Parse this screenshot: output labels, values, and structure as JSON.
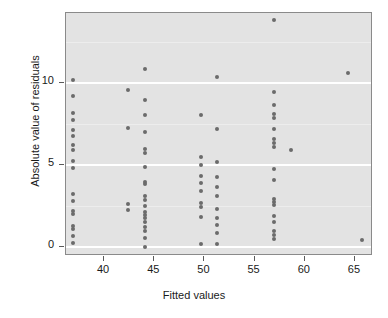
{
  "chart_data": {
    "type": "scatter",
    "title": "",
    "xlabel": "Fitted values",
    "ylabel": "Absolute value of residuals",
    "xlim": [
      36.2,
      66.8
    ],
    "ylim": [
      -0.55,
      14.3
    ],
    "xticks": [
      40,
      45,
      50,
      55,
      60,
      65
    ],
    "xticklabels": [
      "40",
      "45",
      "50",
      "55",
      "60",
      "65"
    ],
    "yticks": [
      0,
      5,
      10
    ],
    "yticklabels": [
      "0",
      "5",
      "10"
    ],
    "grid": true,
    "grid_major_color": "#ffffff",
    "grid_minor_color": "#ededed",
    "panel_background": "#e3e3e3",
    "point_color": "#6b6b6b",
    "point_size_px": 4,
    "series": [
      {
        "name": "residuals",
        "points": [
          [
            36.9,
            10.2
          ],
          [
            36.9,
            9.25
          ],
          [
            36.9,
            8.2
          ],
          [
            36.9,
            7.75
          ],
          [
            36.9,
            7.15
          ],
          [
            36.9,
            6.8
          ],
          [
            36.9,
            6.25
          ],
          [
            36.9,
            5.9
          ],
          [
            36.9,
            5.25
          ],
          [
            36.9,
            4.8
          ],
          [
            36.9,
            3.25
          ],
          [
            36.9,
            2.8
          ],
          [
            36.9,
            2.2
          ],
          [
            36.9,
            2.0
          ],
          [
            36.9,
            1.3
          ],
          [
            36.9,
            1.1
          ],
          [
            36.9,
            0.65
          ],
          [
            36.9,
            0.25
          ],
          [
            42.4,
            9.6
          ],
          [
            42.4,
            7.3
          ],
          [
            42.4,
            2.6
          ],
          [
            42.4,
            2.25
          ],
          [
            44.1,
            10.85
          ],
          [
            44.1,
            9.0
          ],
          [
            44.1,
            8.05
          ],
          [
            44.1,
            7.0
          ],
          [
            44.1,
            6.0
          ],
          [
            44.1,
            5.75
          ],
          [
            44.1,
            4.9
          ],
          [
            44.1,
            4.0
          ],
          [
            44.1,
            3.85
          ],
          [
            44.1,
            3.1
          ],
          [
            44.1,
            2.85
          ],
          [
            44.1,
            2.5
          ],
          [
            44.1,
            2.15
          ],
          [
            44.1,
            1.95
          ],
          [
            44.1,
            1.75
          ],
          [
            44.1,
            1.5
          ],
          [
            44.1,
            1.25
          ],
          [
            44.1,
            1.0
          ],
          [
            44.1,
            0.55
          ],
          [
            44.1,
            0.0
          ],
          [
            49.7,
            8.05
          ],
          [
            49.7,
            5.5
          ],
          [
            49.7,
            5.0
          ],
          [
            49.7,
            4.35
          ],
          [
            49.7,
            3.9
          ],
          [
            49.7,
            3.45
          ],
          [
            49.7,
            2.7
          ],
          [
            49.7,
            2.45
          ],
          [
            49.7,
            1.85
          ],
          [
            49.7,
            0.2
          ],
          [
            51.3,
            10.4
          ],
          [
            51.3,
            7.2
          ],
          [
            51.3,
            5.2
          ],
          [
            51.3,
            4.3
          ],
          [
            51.3,
            3.65
          ],
          [
            51.3,
            3.1
          ],
          [
            51.3,
            2.3
          ],
          [
            51.3,
            1.75
          ],
          [
            51.3,
            1.35
          ],
          [
            51.3,
            0.85
          ],
          [
            51.3,
            0.2
          ],
          [
            56.9,
            13.9
          ],
          [
            56.9,
            9.5
          ],
          [
            56.9,
            8.7
          ],
          [
            56.9,
            8.1
          ],
          [
            56.9,
            7.9
          ],
          [
            56.9,
            7.2
          ],
          [
            56.9,
            6.6
          ],
          [
            56.9,
            6.35
          ],
          [
            56.9,
            6.1
          ],
          [
            56.9,
            4.75
          ],
          [
            56.9,
            4.1
          ],
          [
            56.9,
            2.95
          ],
          [
            56.9,
            2.75
          ],
          [
            56.9,
            2.55
          ],
          [
            56.9,
            1.9
          ],
          [
            56.9,
            1.55
          ],
          [
            56.9,
            1.0
          ],
          [
            56.9,
            0.75
          ],
          [
            56.9,
            0.5
          ],
          [
            58.6,
            5.9
          ],
          [
            64.3,
            10.65
          ],
          [
            65.7,
            0.45
          ]
        ]
      }
    ]
  }
}
